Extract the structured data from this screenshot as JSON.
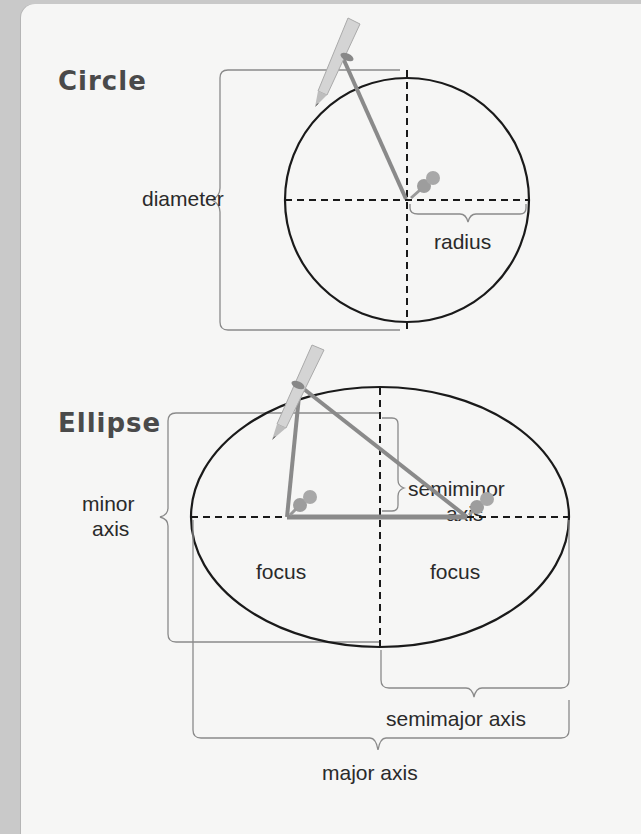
{
  "circle_section": {
    "title": "Circle",
    "labels": {
      "diameter": "diameter",
      "radius": "radius"
    }
  },
  "ellipse_section": {
    "title": "Ellipse",
    "labels": {
      "semiminor_line1": "semiminor",
      "semiminor_line2": "axis",
      "minor_line1": "minor",
      "minor_line2": "axis",
      "focus_left": "focus",
      "focus_right": "focus",
      "semimajor": "semimajor axis",
      "major": "major axis"
    }
  },
  "colors": {
    "background_margin": "#c9c9c9",
    "card": "#f6f6f5",
    "curve": "#1a1a1a",
    "string": "#8a8a8a",
    "bracket": "#7a7a7a",
    "pin": "#9a9a9a",
    "pencil": "#d0d0d0"
  }
}
